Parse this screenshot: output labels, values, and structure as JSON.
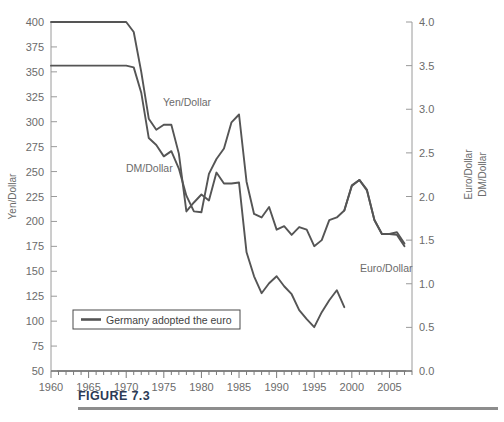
{
  "figure": {
    "caption": "FIGURE 7.3",
    "line_color": "#555555",
    "text_color": "#6b6b6b",
    "caption_color": "#2b3a55"
  },
  "legend": {
    "entries": [
      {
        "label": "Germany adopted the euro",
        "swatch": "line"
      }
    ]
  },
  "annotations": [
    {
      "text": "Yen/Dollar",
      "x": 163,
      "y": 106
    },
    {
      "text": "DM/Dollar",
      "x": 126,
      "y": 172
    },
    {
      "text": "Euro/Dollar",
      "x": 360,
      "y": 272
    }
  ],
  "chart_data": {
    "type": "line",
    "title": "",
    "subtitle": "",
    "xlabel": "",
    "ylabel": "Yen/Dollar",
    "y2label": "Euro/Dollar   DM/Dollar",
    "grid": false,
    "legend_position": "inside-lower-left",
    "xlim": [
      1960,
      2008
    ],
    "ylim": [
      50,
      400
    ],
    "y2lim": [
      0.0,
      4.0
    ],
    "xticks": [
      1960,
      1965,
      1970,
      1975,
      1980,
      1985,
      1990,
      1995,
      2000,
      2005
    ],
    "xtick_labels": [
      "1960",
      "1965",
      "1970",
      "1975",
      "1980",
      "1985",
      "1990",
      "1995",
      "2000",
      "2005"
    ],
    "xminor_step": 1,
    "yticks": [
      50,
      75,
      100,
      125,
      150,
      175,
      200,
      225,
      250,
      275,
      300,
      325,
      350,
      375,
      400
    ],
    "ytick_labels": [
      "50",
      "75",
      "100",
      "125",
      "150",
      "175",
      "200",
      "225",
      "250",
      "275",
      "300",
      "325",
      "350",
      "375",
      "400"
    ],
    "y2ticks": [
      0.0,
      0.5,
      1.0,
      1.5,
      2.0,
      2.5,
      3.0,
      3.5,
      4.0
    ],
    "y2tick_labels": [
      "0.0",
      "0.5",
      "1.0",
      "1.5",
      "2.0",
      "2.5",
      "3.0",
      "3.5",
      "4.0"
    ],
    "series": [
      {
        "name": "Yen/Dollar",
        "axis": "left",
        "color": "#555555",
        "x": [
          1960,
          1961,
          1962,
          1963,
          1964,
          1965,
          1966,
          1967,
          1968,
          1969,
          1970,
          1971,
          1972,
          1973,
          1974,
          1975,
          1976,
          1977,
          1978,
          1979,
          1980,
          1981,
          1982,
          1983,
          1984,
          1985,
          1986,
          1987,
          1988,
          1989,
          1990,
          1991,
          1992,
          1993,
          1994,
          1995,
          1996,
          1997,
          1998,
          1999
        ],
        "values": [
          400,
          400,
          400,
          400,
          400,
          400,
          400,
          400,
          400,
          400,
          400,
          390,
          350,
          303,
          292,
          297,
          297,
          268,
          210,
          219,
          227,
          221,
          249,
          238,
          238,
          239,
          169,
          145,
          128,
          138,
          145,
          135,
          127,
          111,
          102,
          94,
          109,
          121,
          131,
          114
        ]
      },
      {
        "name": "DM/Dollar and Euro/Dollar",
        "axis": "right",
        "color": "#555555",
        "x": [
          1960,
          1961,
          1962,
          1963,
          1964,
          1965,
          1966,
          1967,
          1968,
          1969,
          1970,
          1971,
          1972,
          1973,
          1974,
          1975,
          1976,
          1977,
          1978,
          1979,
          1980,
          1981,
          1982,
          1983,
          1984,
          1985,
          1986,
          1987,
          1988,
          1989,
          1990,
          1991,
          1992,
          1993,
          1994,
          1995,
          1996,
          1997,
          1998,
          1999,
          2000,
          2001,
          2002,
          2003,
          2004,
          2005,
          2006,
          2007
        ],
        "values": [
          3.5,
          3.5,
          3.5,
          3.5,
          3.5,
          3.5,
          3.5,
          3.5,
          3.5,
          3.5,
          3.5,
          3.48,
          3.19,
          2.67,
          2.59,
          2.46,
          2.52,
          2.32,
          2.01,
          1.83,
          1.82,
          2.26,
          2.43,
          2.55,
          2.85,
          2.94,
          2.17,
          1.8,
          1.76,
          1.88,
          1.62,
          1.66,
          1.56,
          1.65,
          1.62,
          1.43,
          1.5,
          1.73,
          1.76,
          1.84,
          2.12,
          2.19,
          2.08,
          1.73,
          1.57,
          1.57,
          1.56,
          1.43
        ]
      },
      {
        "name": "Euro/Dollar (post-1999)",
        "axis": "right",
        "color": "#555555",
        "x": [
          1999,
          2000,
          2001,
          2002,
          2003,
          2004,
          2005,
          2006,
          2007
        ],
        "values": [
          1.84,
          2.13,
          2.19,
          2.07,
          1.73,
          1.57,
          1.57,
          1.59,
          1.46
        ]
      }
    ]
  }
}
